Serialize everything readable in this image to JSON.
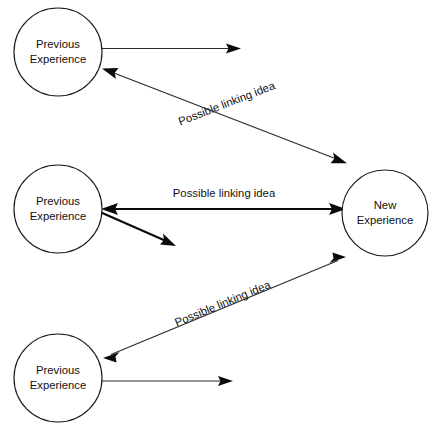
{
  "diagram": {
    "background_color": "#ffffff",
    "stroke_color": "#111111",
    "text_color": "#111111",
    "nodes": [
      {
        "id": "previous-experience-top",
        "line1": "Previous",
        "line2": "Experience",
        "cx": 58,
        "cy": 52,
        "r": 44
      },
      {
        "id": "previous-experience-middle",
        "line1": "Previous",
        "line2": "Experience",
        "cx": 58,
        "cy": 209,
        "r": 44
      },
      {
        "id": "previous-experience-bottom",
        "line1": "Previous",
        "line2": "Experience",
        "cx": 58,
        "cy": 378,
        "r": 44
      },
      {
        "id": "new-experience",
        "line1": "New",
        "line2": "Experience",
        "cx": 385,
        "cy": 213,
        "r": 43
      }
    ],
    "edges": [
      {
        "id": "stub-top",
        "label": "",
        "from": "previous-experience-top",
        "to": "",
        "arrows": "end"
      },
      {
        "id": "linking-top",
        "label": "Possible linking idea",
        "from": "previous-experience-top",
        "to": "new-experience",
        "arrows": "both",
        "label_rotation": -21
      },
      {
        "id": "linking-middle",
        "label": "Possible linking idea",
        "from": "previous-experience-middle",
        "to": "new-experience",
        "arrows": "both",
        "label_rotation": 0
      },
      {
        "id": "stub-middle",
        "label": "",
        "from": "previous-experience-middle",
        "to": "",
        "arrows": "end"
      },
      {
        "id": "linking-bottom",
        "label": "Possible linking idea",
        "from": "previous-experience-bottom",
        "to": "new-experience",
        "arrows": "both",
        "label_rotation": -22.5
      },
      {
        "id": "stub-bottom",
        "label": "",
        "from": "previous-experience-bottom",
        "to": "",
        "arrows": "end"
      }
    ]
  }
}
